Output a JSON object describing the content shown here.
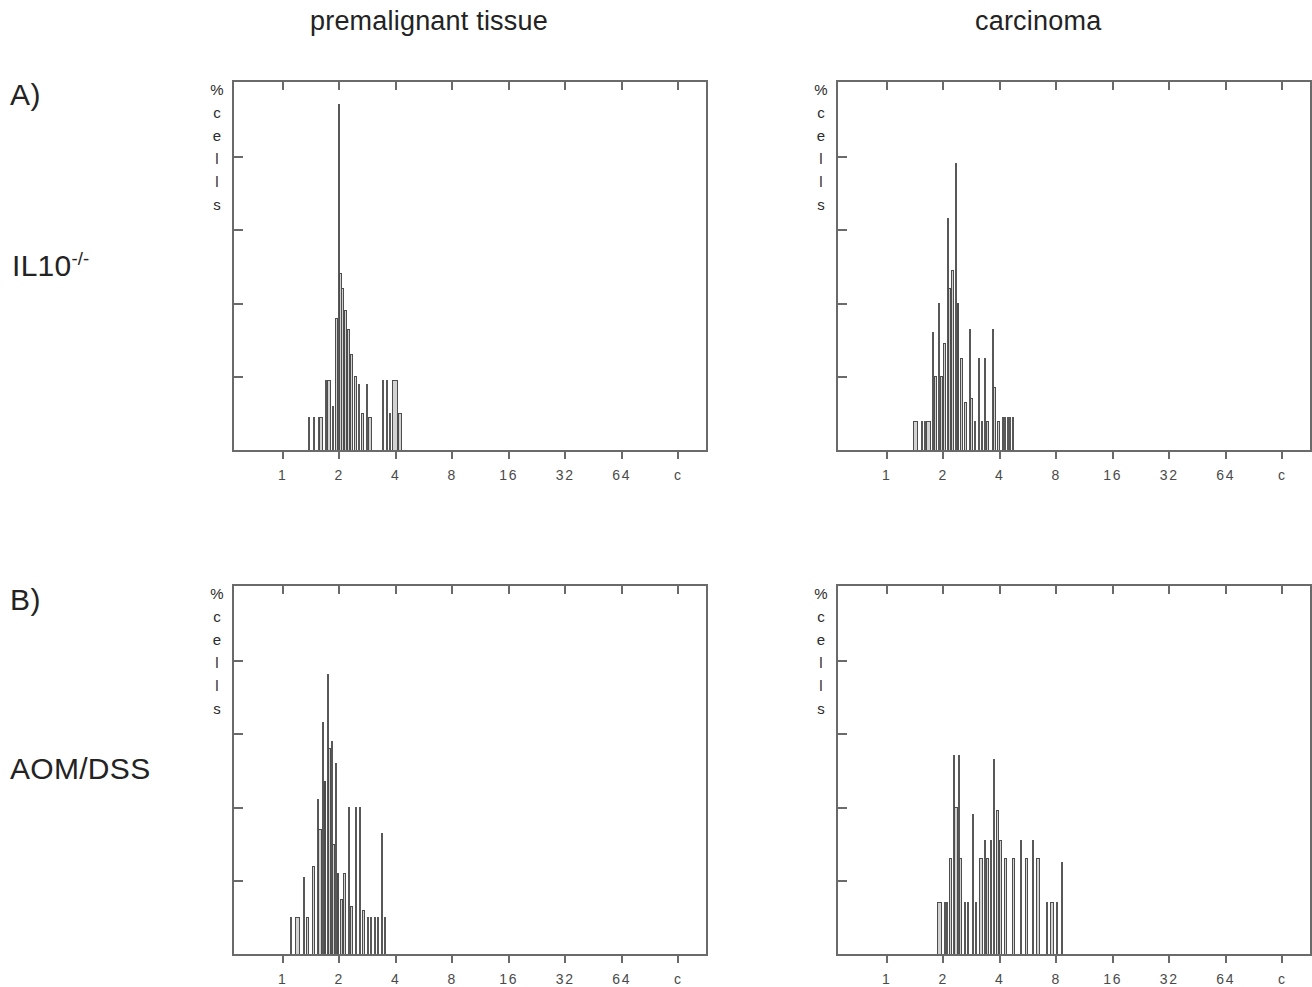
{
  "figure": {
    "columns": [
      {
        "id": "premalignant",
        "label": "premalignant tissue"
      },
      {
        "id": "carcinoma",
        "label": "carcinoma"
      }
    ],
    "rows": [
      {
        "id": "il10",
        "letter": "A)",
        "label_main": "IL10",
        "label_sup": "-/-"
      },
      {
        "id": "aomdss",
        "letter": "B)",
        "label_main": "AOM/DSS",
        "label_sup": ""
      }
    ],
    "y_axis_label_chars": [
      "%",
      "c",
      "e",
      "l",
      "l",
      "s"
    ],
    "colors": {
      "fill": "#d2d2d2",
      "outline": "#4d4d4d",
      "axis": "#6a6a6a",
      "text": "#232323"
    }
  },
  "chart_data": [
    {
      "id": "panel-a-premalignant",
      "type": "bar",
      "title": "premalignant tissue",
      "row": "IL10-/-",
      "panel": "A)",
      "xlabel": "",
      "ylabel": "% cells",
      "x_scale": "log2",
      "xticks": [
        "1",
        "2",
        "4",
        "8",
        "16",
        "32",
        "64",
        "c"
      ],
      "xtick_positions": [
        1,
        2,
        4,
        8,
        16,
        32,
        64,
        128
      ],
      "xlim": [
        0.55,
        180
      ],
      "ylim": [
        0,
        100
      ],
      "y_tick_count": 4,
      "grid": false,
      "legend": "none",
      "bins": [
        {
          "x": 1.38,
          "w": 0.022,
          "h": 9,
          "thin": true
        },
        {
          "x": 1.46,
          "w": 0.022,
          "h": 9,
          "thin": true
        },
        {
          "x": 1.56,
          "w": 0.022,
          "h": 9,
          "thin": true
        },
        {
          "x": 1.6,
          "w": 0.075,
          "h": 9,
          "thin": false
        },
        {
          "x": 1.7,
          "w": 0.03,
          "h": 19,
          "thin": true
        },
        {
          "x": 1.76,
          "w": 0.075,
          "h": 19,
          "thin": false
        },
        {
          "x": 1.86,
          "w": 0.03,
          "h": 12,
          "thin": true
        },
        {
          "x": 1.93,
          "w": 0.055,
          "h": 36,
          "thin": false
        },
        {
          "x": 1.99,
          "w": 0.03,
          "h": 94,
          "thin": true
        },
        {
          "x": 2.03,
          "w": 0.055,
          "h": 48,
          "thin": false
        },
        {
          "x": 2.09,
          "w": 0.05,
          "h": 44,
          "thin": false
        },
        {
          "x": 2.16,
          "w": 0.05,
          "h": 38,
          "thin": false
        },
        {
          "x": 2.24,
          "w": 0.055,
          "h": 33,
          "thin": false
        },
        {
          "x": 2.33,
          "w": 0.06,
          "h": 26,
          "thin": false
        },
        {
          "x": 2.44,
          "w": 0.06,
          "h": 20,
          "thin": false
        },
        {
          "x": 2.56,
          "w": 0.038,
          "h": 18,
          "thin": true
        },
        {
          "x": 2.66,
          "w": 0.06,
          "h": 10,
          "thin": false
        },
        {
          "x": 2.8,
          "w": 0.03,
          "h": 18,
          "thin": true
        },
        {
          "x": 2.92,
          "w": 0.06,
          "h": 9,
          "thin": false
        },
        {
          "x": 3.42,
          "w": 0.03,
          "h": 19,
          "thin": true
        },
        {
          "x": 3.6,
          "w": 0.03,
          "h": 19,
          "thin": true
        },
        {
          "x": 3.72,
          "w": 0.03,
          "h": 10,
          "thin": true
        },
        {
          "x": 3.86,
          "w": 0.038,
          "h": 19,
          "thin": true
        },
        {
          "x": 3.98,
          "w": 0.11,
          "h": 19,
          "thin": false
        },
        {
          "x": 4.22,
          "w": 0.06,
          "h": 10,
          "thin": false
        }
      ]
    },
    {
      "id": "panel-a-carcinoma",
      "type": "bar",
      "title": "carcinoma",
      "row": "IL10-/-",
      "panel": "A)",
      "xlabel": "",
      "ylabel": "% cells",
      "x_scale": "log2",
      "xticks": [
        "1",
        "2",
        "4",
        "8",
        "16",
        "32",
        "64",
        "c"
      ],
      "xtick_positions": [
        1,
        2,
        4,
        8,
        16,
        32,
        64,
        128
      ],
      "xlim": [
        0.55,
        180
      ],
      "ylim": [
        0,
        100
      ],
      "y_tick_count": 4,
      "grid": false,
      "legend": "none",
      "bins": [
        {
          "x": 1.42,
          "w": 0.09,
          "h": 8,
          "thin": false
        },
        {
          "x": 1.54,
          "w": 0.026,
          "h": 8,
          "thin": true
        },
        {
          "x": 1.6,
          "w": 0.026,
          "h": 8,
          "thin": true
        },
        {
          "x": 1.67,
          "w": 0.075,
          "h": 8,
          "thin": false
        },
        {
          "x": 1.76,
          "w": 0.026,
          "h": 32,
          "thin": true
        },
        {
          "x": 1.82,
          "w": 0.06,
          "h": 20,
          "thin": false
        },
        {
          "x": 1.9,
          "w": 0.026,
          "h": 40,
          "thin": true
        },
        {
          "x": 1.96,
          "w": 0.055,
          "h": 20,
          "thin": false
        },
        {
          "x": 2.04,
          "w": 0.05,
          "h": 29,
          "thin": false
        },
        {
          "x": 2.11,
          "w": 0.03,
          "h": 63,
          "thin": true
        },
        {
          "x": 2.17,
          "w": 0.05,
          "h": 44,
          "thin": false
        },
        {
          "x": 2.25,
          "w": 0.05,
          "h": 49,
          "thin": false
        },
        {
          "x": 2.34,
          "w": 0.028,
          "h": 78,
          "thin": true
        },
        {
          "x": 2.4,
          "w": 0.05,
          "h": 40,
          "thin": false
        },
        {
          "x": 2.5,
          "w": 0.05,
          "h": 25,
          "thin": false
        },
        {
          "x": 2.62,
          "w": 0.05,
          "h": 13,
          "thin": false
        },
        {
          "x": 2.76,
          "w": 0.028,
          "h": 33,
          "thin": true
        },
        {
          "x": 2.84,
          "w": 0.05,
          "h": 14,
          "thin": false
        },
        {
          "x": 2.96,
          "w": 0.028,
          "h": 8,
          "thin": true
        },
        {
          "x": 3.1,
          "w": 0.028,
          "h": 25,
          "thin": true
        },
        {
          "x": 3.22,
          "w": 0.028,
          "h": 8,
          "thin": true
        },
        {
          "x": 3.34,
          "w": 0.028,
          "h": 25,
          "thin": true
        },
        {
          "x": 3.46,
          "w": 0.05,
          "h": 8,
          "thin": false
        },
        {
          "x": 3.66,
          "w": 0.03,
          "h": 33,
          "thin": true
        },
        {
          "x": 3.76,
          "w": 0.06,
          "h": 17,
          "thin": false
        },
        {
          "x": 3.94,
          "w": 0.06,
          "h": 8,
          "thin": false
        },
        {
          "x": 4.18,
          "w": 0.036,
          "h": 9,
          "thin": true
        },
        {
          "x": 4.28,
          "w": 0.036,
          "h": 9,
          "thin": true
        },
        {
          "x": 4.42,
          "w": 0.036,
          "h": 9,
          "thin": true
        },
        {
          "x": 4.54,
          "w": 0.036,
          "h": 9,
          "thin": true
        },
        {
          "x": 4.7,
          "w": 0.036,
          "h": 9,
          "thin": true
        }
      ]
    },
    {
      "id": "panel-b-premalignant",
      "type": "bar",
      "title": "premalignant tissue",
      "row": "AOM/DSS",
      "panel": "B)",
      "xlabel": "",
      "ylabel": "% cells",
      "x_scale": "log2",
      "xticks": [
        "1",
        "2",
        "4",
        "8",
        "16",
        "32",
        "64",
        "c"
      ],
      "xtick_positions": [
        1,
        2,
        4,
        8,
        16,
        32,
        64,
        128
      ],
      "xlim": [
        0.55,
        180
      ],
      "ylim": [
        0,
        100
      ],
      "y_tick_count": 4,
      "grid": false,
      "legend": "none",
      "bins": [
        {
          "x": 1.1,
          "w": 0.026,
          "h": 10,
          "thin": true
        },
        {
          "x": 1.2,
          "w": 0.075,
          "h": 10,
          "thin": false
        },
        {
          "x": 1.3,
          "w": 0.026,
          "h": 21,
          "thin": true
        },
        {
          "x": 1.36,
          "w": 0.06,
          "h": 10,
          "thin": false
        },
        {
          "x": 1.46,
          "w": 0.055,
          "h": 24,
          "thin": false
        },
        {
          "x": 1.53,
          "w": 0.03,
          "h": 42,
          "thin": true
        },
        {
          "x": 1.58,
          "w": 0.055,
          "h": 34,
          "thin": false
        },
        {
          "x": 1.64,
          "w": 0.03,
          "h": 63,
          "thin": true
        },
        {
          "x": 1.68,
          "w": 0.05,
          "h": 47,
          "thin": false
        },
        {
          "x": 1.73,
          "w": 0.026,
          "h": 76,
          "thin": true
        },
        {
          "x": 1.77,
          "w": 0.05,
          "h": 56,
          "thin": false
        },
        {
          "x": 1.82,
          "w": 0.026,
          "h": 58,
          "thin": true
        },
        {
          "x": 1.86,
          "w": 0.05,
          "h": 30,
          "thin": false
        },
        {
          "x": 1.92,
          "w": 0.026,
          "h": 52,
          "thin": true
        },
        {
          "x": 1.97,
          "w": 0.05,
          "h": 22,
          "thin": false
        },
        {
          "x": 2.05,
          "w": 0.05,
          "h": 15,
          "thin": false
        },
        {
          "x": 2.14,
          "w": 0.05,
          "h": 22,
          "thin": false
        },
        {
          "x": 2.24,
          "w": 0.026,
          "h": 40,
          "thin": true
        },
        {
          "x": 2.32,
          "w": 0.055,
          "h": 13,
          "thin": false
        },
        {
          "x": 2.46,
          "w": 0.026,
          "h": 40,
          "thin": true
        },
        {
          "x": 2.58,
          "w": 0.026,
          "h": 40,
          "thin": true
        },
        {
          "x": 2.68,
          "w": 0.055,
          "h": 12,
          "thin": false
        },
        {
          "x": 2.84,
          "w": 0.026,
          "h": 10,
          "thin": true
        },
        {
          "x": 2.96,
          "w": 0.026,
          "h": 10,
          "thin": true
        },
        {
          "x": 3.08,
          "w": 0.026,
          "h": 10,
          "thin": true
        },
        {
          "x": 3.22,
          "w": 0.026,
          "h": 10,
          "thin": true
        },
        {
          "x": 3.38,
          "w": 0.03,
          "h": 33,
          "thin": true
        },
        {
          "x": 3.5,
          "w": 0.03,
          "h": 10,
          "thin": true
        }
      ]
    },
    {
      "id": "panel-b-carcinoma",
      "type": "bar",
      "title": "carcinoma",
      "row": "AOM/DSS",
      "panel": "B)",
      "xlabel": "",
      "ylabel": "% cells",
      "x_scale": "log2",
      "xticks": [
        "1",
        "2",
        "4",
        "8",
        "16",
        "32",
        "64",
        "c"
      ],
      "xtick_positions": [
        1,
        2,
        4,
        8,
        16,
        32,
        64,
        128
      ],
      "xlim": [
        0.55,
        180
      ],
      "ylim": [
        0,
        100
      ],
      "y_tick_count": 4,
      "grid": false,
      "legend": "none",
      "bins": [
        {
          "x": 1.9,
          "w": 0.09,
          "h": 14,
          "thin": false
        },
        {
          "x": 2.03,
          "w": 0.028,
          "h": 14,
          "thin": true
        },
        {
          "x": 2.1,
          "w": 0.028,
          "h": 14,
          "thin": true
        },
        {
          "x": 2.19,
          "w": 0.06,
          "h": 26,
          "thin": false
        },
        {
          "x": 2.28,
          "w": 0.03,
          "h": 54,
          "thin": true
        },
        {
          "x": 2.34,
          "w": 0.055,
          "h": 40,
          "thin": false
        },
        {
          "x": 2.41,
          "w": 0.03,
          "h": 54,
          "thin": true
        },
        {
          "x": 2.48,
          "w": 0.055,
          "h": 26,
          "thin": false
        },
        {
          "x": 2.6,
          "w": 0.03,
          "h": 14,
          "thin": true
        },
        {
          "x": 2.72,
          "w": 0.03,
          "h": 14,
          "thin": true
        },
        {
          "x": 2.86,
          "w": 0.03,
          "h": 38,
          "thin": true
        },
        {
          "x": 3.0,
          "w": 0.03,
          "h": 14,
          "thin": true
        },
        {
          "x": 3.18,
          "w": 0.06,
          "h": 26,
          "thin": false
        },
        {
          "x": 3.32,
          "w": 0.03,
          "h": 31,
          "thin": true
        },
        {
          "x": 3.46,
          "w": 0.055,
          "h": 26,
          "thin": false
        },
        {
          "x": 3.6,
          "w": 0.03,
          "h": 31,
          "thin": true
        },
        {
          "x": 3.74,
          "w": 0.03,
          "h": 53,
          "thin": true
        },
        {
          "x": 3.88,
          "w": 0.06,
          "h": 39,
          "thin": false
        },
        {
          "x": 4.04,
          "w": 0.055,
          "h": 31,
          "thin": false
        },
        {
          "x": 4.3,
          "w": 0.06,
          "h": 26,
          "thin": false
        },
        {
          "x": 4.72,
          "w": 0.06,
          "h": 26,
          "thin": false
        },
        {
          "x": 5.2,
          "w": 0.03,
          "h": 31,
          "thin": true
        },
        {
          "x": 5.56,
          "w": 0.055,
          "h": 26,
          "thin": false
        },
        {
          "x": 6.0,
          "w": 0.03,
          "h": 31,
          "thin": true
        },
        {
          "x": 6.4,
          "w": 0.055,
          "h": 26,
          "thin": false
        },
        {
          "x": 7.1,
          "w": 0.03,
          "h": 14,
          "thin": true
        },
        {
          "x": 7.6,
          "w": 0.055,
          "h": 14,
          "thin": false
        },
        {
          "x": 8.1,
          "w": 0.03,
          "h": 14,
          "thin": true
        },
        {
          "x": 8.6,
          "w": 0.032,
          "h": 25,
          "thin": true
        }
      ]
    }
  ]
}
